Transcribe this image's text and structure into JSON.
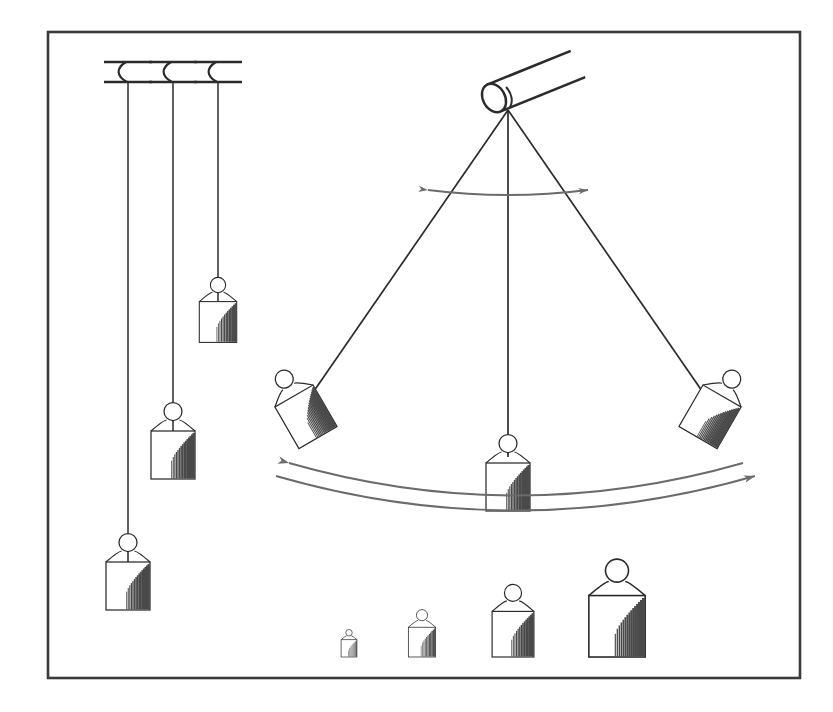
{
  "figure": {
    "background_color": "#ffffff",
    "ink_color": "#2b2b2b",
    "ink_color_light": "#6b6b6b",
    "shade_color": "#4a4a4a"
  },
  "frame": {
    "name": "diagram-border",
    "x": 48,
    "y": 32,
    "width": 752,
    "height": 646,
    "stroke_width": 2.6,
    "color": "#3a3a3a"
  },
  "ceiling_brackets": [
    {
      "label": "bracket-1",
      "x": 128,
      "y_top": 62,
      "y_bottom": 82,
      "half_width": 24
    },
    {
      "label": "bracket-2",
      "x": 173,
      "y_top": 62,
      "y_bottom": 82,
      "half_width": 24
    },
    {
      "label": "bracket-3",
      "x": 218,
      "y_top": 62,
      "y_bottom": 82,
      "half_width": 24
    }
  ],
  "hanging_pendulums": [
    {
      "label": "pendulum-long",
      "string_x": 128,
      "string_top": 82,
      "string_bottom": 586,
      "bob": {
        "cx": 128,
        "cy": 586,
        "scale": 1.0,
        "rotation": 0
      },
      "length_note": "longest"
    },
    {
      "label": "pendulum-medium",
      "string_x": 173,
      "string_top": 82,
      "string_bottom": 455,
      "bob": {
        "cx": 173,
        "cy": 455,
        "scale": 1.0,
        "rotation": 0
      },
      "length_note": "medium"
    },
    {
      "label": "pendulum-short",
      "string_x": 218,
      "string_top": 82,
      "string_bottom": 322,
      "bob": {
        "cx": 218,
        "cy": 322,
        "scale": 0.85,
        "rotation": 0
      },
      "length_note": "shortest"
    }
  ],
  "pivot": {
    "label": "cylindrical-rod-pivot",
    "anchor_x": 508,
    "anchor_y": 110,
    "cap_cx": 494,
    "cap_cy": 98,
    "cap_rx": 11,
    "cap_ry": 15,
    "rod_tip_x": 578,
    "rod_tip_y": 64,
    "rod_angle_deg": -29
  },
  "swinging_pendulum": {
    "label": "swinging-pendulum",
    "pivot_x": 508,
    "pivot_y": 110,
    "positions": [
      {
        "label": "position-left-extreme",
        "bob_cx": 294,
        "bob_cy": 420,
        "rotation": -30,
        "scale": 1.0
      },
      {
        "label": "position-center-rest",
        "bob_cx": 508,
        "bob_cy": 487,
        "rotation": 0,
        "scale": 1.0
      },
      {
        "label": "position-right-extreme",
        "bob_cx": 722,
        "bob_cy": 420,
        "rotation": 30,
        "scale": 1.0
      }
    ]
  },
  "angle_arrow": {
    "label": "amplitude-angle-arrow",
    "description": "double-headed curved arrow between the two outer strings near the pivot",
    "start_x": 428,
    "start_y": 190,
    "end_x": 588,
    "end_y": 190,
    "sag_y": 200,
    "double_headed": true
  },
  "swing_arrows": [
    {
      "label": "swing-arc-arrow-leftward",
      "description": "upper arc with arrowhead at the left end",
      "arrow_end": "left",
      "start_x": 289,
      "start_y": 463,
      "end_x": 743,
      "end_y": 463,
      "sag_y": 528
    },
    {
      "label": "swing-arc-arrow-rightward",
      "description": "lower arc with arrowhead at the right end",
      "arrow_end": "right",
      "start_x": 276,
      "start_y": 476,
      "end_x": 755,
      "end_y": 476,
      "sag_y": 545
    }
  ],
  "weight_set": {
    "label": "calibration-weight-row",
    "description": "four free-standing weights of increasing mass resting along the bottom",
    "items": [
      {
        "label": "weight-smallest",
        "cx": 349,
        "base_y": 657,
        "scale": 0.36
      },
      {
        "label": "weight-small",
        "cx": 422,
        "base_y": 657,
        "scale": 0.62
      },
      {
        "label": "weight-medium",
        "cx": 513,
        "base_y": 657,
        "scale": 0.95
      },
      {
        "label": "weight-large",
        "cx": 617,
        "base_y": 657,
        "scale": 1.28
      }
    ]
  },
  "bob_shape": {
    "description": "hanging weight: small open ring at top, sloped shoulders, rectangular body, vertical hatch shading on right portion",
    "body_half_width": 22,
    "body_height": 48,
    "shoulder_height": 12,
    "ring_radius": 9
  }
}
